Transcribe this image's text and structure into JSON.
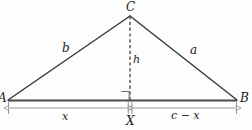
{
  "figure": {
    "type": "geometry-diagram",
    "background_color": "#fdfdfd",
    "stroke_color": "#3a3a3a",
    "base_color": "#4a4a4a",
    "dimension_color": "#9a9a9a",
    "labels": {
      "apex": "C",
      "left_vertex": "A",
      "right_vertex": "B",
      "foot": "X",
      "left_side": "b",
      "right_side": "a",
      "altitude": "h",
      "left_segment": "x",
      "right_segment": "c − x"
    },
    "geometry": {
      "A": [
        8,
        100
      ],
      "B": [
        237,
        100
      ],
      "C": [
        130,
        16
      ],
      "X": [
        130,
        100
      ],
      "dimension_line_y": 108,
      "right_angle_size": 8
    }
  }
}
